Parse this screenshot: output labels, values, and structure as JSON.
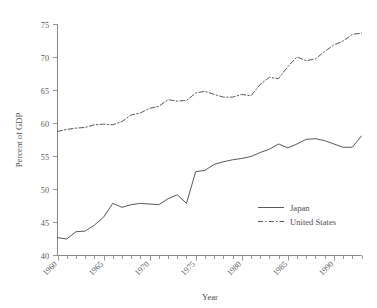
{
  "chart_data": {
    "type": "line",
    "title": "",
    "subtitle": "",
    "xlabel": "Year",
    "ylabel": "Percent of GDP",
    "xlim": [
      1960,
      1993
    ],
    "ylim": [
      40,
      75
    ],
    "y_ticks": [
      40,
      45,
      50,
      55,
      60,
      65,
      70,
      75
    ],
    "x_ticks_major": [
      1960,
      1965,
      1970,
      1975,
      1980,
      1985,
      1990
    ],
    "x_ticks_minor_step": 1,
    "x_tick_label_rotation": -45,
    "grid": false,
    "legend_position": "center-right",
    "x": [
      1960,
      1961,
      1962,
      1963,
      1964,
      1965,
      1966,
      1967,
      1968,
      1969,
      1970,
      1971,
      1972,
      1973,
      1974,
      1975,
      1976,
      1977,
      1978,
      1979,
      1980,
      1981,
      1982,
      1983,
      1984,
      1985,
      1986,
      1987,
      1988,
      1989,
      1990,
      1991,
      1992,
      1993
    ],
    "series": [
      {
        "name": "Japan",
        "style": "solid",
        "values": [
          42.7,
          42.5,
          43.6,
          43.7,
          44.6,
          45.8,
          47.9,
          47.3,
          47.7,
          47.9,
          47.8,
          47.7,
          48.6,
          49.2,
          47.9,
          52.7,
          52.9,
          53.8,
          54.2,
          54.5,
          54.7,
          55.0,
          55.6,
          56.1,
          56.9,
          56.3,
          56.9,
          57.6,
          57.7,
          57.4,
          56.9,
          56.4,
          56.4,
          58.1
        ]
      },
      {
        "name": "United States",
        "style": "dash-dot",
        "values": [
          58.8,
          59.1,
          59.3,
          59.4,
          59.8,
          59.9,
          59.8,
          60.3,
          61.3,
          61.6,
          62.3,
          62.6,
          63.6,
          63.4,
          63.5,
          64.6,
          64.9,
          64.4,
          64.0,
          64.0,
          64.4,
          64.2,
          65.9,
          67.0,
          66.8,
          68.6,
          70.1,
          69.5,
          69.8,
          70.9,
          71.9,
          72.5,
          73.5,
          73.7
        ]
      }
    ]
  },
  "legend": {
    "items": [
      {
        "label": "Japan",
        "style": "solid"
      },
      {
        "label": "United States",
        "style": "dash-dot"
      }
    ]
  },
  "axes": {
    "y_label": "Percent of GDP",
    "x_label": "Year",
    "y_tick_labels": [
      "40",
      "45",
      "50",
      "55",
      "60",
      "65",
      "70",
      "75"
    ],
    "x_tick_labels": [
      "1960",
      "1965",
      "1970",
      "1975",
      "1980",
      "1985",
      "1990"
    ]
  },
  "colors": {
    "line": "#58585c",
    "axis": "#7a7a7a",
    "text": "#4f4f4f",
    "background": "#ffffff"
  }
}
